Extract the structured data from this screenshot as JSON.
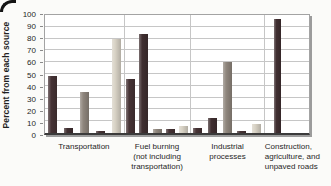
{
  "colors": {
    "background": "#fbfbf9",
    "text": "#1f1f1f",
    "grid": "#c6c6c6",
    "frame": "#a3a3a3",
    "baseline": "#3b3b3b",
    "shadow": "#9c9c9c",
    "corner": "#141414"
  },
  "chart_data": {
    "type": "bar",
    "title": "",
    "xlabel": "",
    "ylabel": "Percent from each source",
    "ylim": [
      0,
      100
    ],
    "ygrid_step": 10,
    "yticks": [
      100,
      90,
      80,
      70,
      60,
      50,
      40,
      30,
      20,
      10,
      0
    ],
    "grid": "on",
    "legend": "none",
    "categories": [
      "Transportation",
      "Fuel burning (not including transportation)",
      "Industrial processes",
      "Construction, agriculture, and unpaved roads"
    ],
    "category_label_lines": [
      [
        "Transportation"
      ],
      [
        "Fuel burning",
        "(not including",
        "transportation)"
      ],
      [
        "Industrial",
        "processes"
      ],
      [
        "Construction,",
        "agriculture, and",
        "unpaved roads"
      ]
    ],
    "group_widths_pct": [
      30,
      25,
      28,
      17
    ],
    "series": [
      {
        "name": "series-1-dark-maroon",
        "color": "#463335",
        "values": [
          48,
          46,
          4,
          null
        ]
      },
      {
        "name": "series-2-dark-maroon",
        "color": "#402f31",
        "values": [
          4,
          84,
          13,
          97
        ]
      },
      {
        "name": "series-3-warm-gray",
        "color": "#8f867d",
        "values": [
          35,
          3,
          60,
          null
        ]
      },
      {
        "name": "series-4-dark-maroon",
        "color": "#463335",
        "values": [
          2,
          3,
          2,
          null
        ]
      },
      {
        "name": "series-5-light-tan",
        "color": "#d8d2c5",
        "values": [
          80,
          6,
          8,
          null
        ]
      }
    ]
  }
}
